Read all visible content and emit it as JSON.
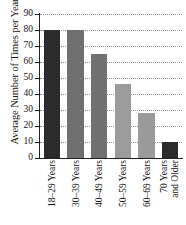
{
  "chart_data": {
    "type": "bar",
    "title": "",
    "xlabel": "",
    "ylabel": "Average Number of Times per Year",
    "categories": [
      "18–29 Years",
      "30–39 Years",
      "40–49 Years",
      "50–59 Years",
      "60–69 Years",
      "70 Years and Older"
    ],
    "values": [
      80,
      80,
      65,
      46,
      28,
      10
    ],
    "ylim": [
      0,
      90
    ],
    "yticks": [
      0,
      10,
      20,
      30,
      40,
      50,
      60,
      70,
      80,
      90
    ],
    "ytick_labels": [
      "0",
      "10",
      "20",
      "30",
      "40",
      "50",
      "60",
      "70",
      "80",
      "90"
    ],
    "grid": "horizontal-dotted",
    "legend": "none",
    "bar_colors": [
      "#2c2c2c",
      "#6f6f6f",
      "#707070",
      "#9b9b9b",
      "#9a9a9a",
      "#2b2b2b"
    ]
  },
  "xtick_lines": [
    {
      "l1": "18–29 Years",
      "l2": ""
    },
    {
      "l1": "30–39 Years",
      "l2": ""
    },
    {
      "l1": "40–49 Years",
      "l2": ""
    },
    {
      "l1": "50–59 Years",
      "l2": ""
    },
    {
      "l1": "60–69 Years",
      "l2": ""
    },
    {
      "l1": "70 Years",
      "l2": "and Older"
    }
  ]
}
